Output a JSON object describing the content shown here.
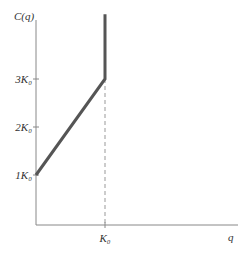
{
  "chart_data": {
    "type": "line",
    "title": "",
    "ylabel": "C(q)",
    "xlabel": "q",
    "x_ticks": [
      {
        "value": 1,
        "label": "K₀"
      }
    ],
    "y_ticks": [
      {
        "value": 1,
        "label": "1K₀"
      },
      {
        "value": 2,
        "label": "2K₀"
      },
      {
        "value": 3,
        "label": "3K₀"
      }
    ],
    "xlim": [
      0,
      1.9
    ],
    "ylim": [
      -1.0,
      4.35
    ],
    "series": [
      {
        "name": "C(q)",
        "color": "#555555",
        "points": [
          [
            0,
            1
          ],
          [
            1,
            3
          ],
          [
            1,
            4.35
          ]
        ]
      }
    ],
    "annotations": [
      {
        "type": "dashed-vertical",
        "x": 1,
        "from_y": -1.0,
        "to_y": 3
      }
    ],
    "grid": false
  }
}
